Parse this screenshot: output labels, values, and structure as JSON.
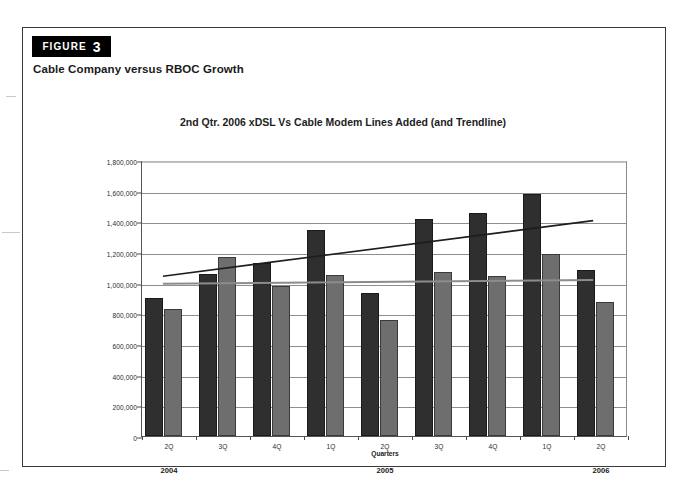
{
  "figure": {
    "banner_word": "FIGURE",
    "banner_number": "3",
    "caption": "Cable Company versus RBOC Growth"
  },
  "chart_data": {
    "type": "bar",
    "title": "2nd Qtr.  2006 xDSL Vs Cable Modem Lines Added (and Trendline)",
    "xlabel": "Quarters",
    "ylabel": "",
    "ylim": [
      0,
      1800000
    ],
    "ytick_step": 200000,
    "grid": true,
    "legend": "none",
    "categories": [
      "2Q",
      "3Q",
      "4Q",
      "1Q",
      "2Q",
      "3Q",
      "4Q",
      "1Q",
      "2Q"
    ],
    "group_labels": [
      {
        "label": "2004",
        "index": 0
      },
      {
        "label": "2005",
        "index": 4
      },
      {
        "label": "2006",
        "index": 8
      }
    ],
    "ytick_labels": [
      "1,800,000",
      "1,600,000",
      "1,400,000",
      "1,200,000",
      "1,000,000",
      "800,000",
      "600,000",
      "400,000",
      "200,000",
      "0"
    ],
    "ytick_values": [
      1800000,
      1600000,
      1400000,
      1200000,
      1000000,
      800000,
      600000,
      400000,
      200000,
      0
    ],
    "series": [
      {
        "name": "xDSL Lines Added",
        "color": "#2f2f2f",
        "values": [
          900000,
          1056000,
          1128000,
          1343000,
          932000,
          1415000,
          1454000,
          1578000,
          1083000
        ]
      },
      {
        "name": "Cable Modem Lines Added",
        "color": "#6e6e6e",
        "values": [
          828000,
          1167000,
          978000,
          1050000,
          756000,
          1070000,
          1044000,
          1187000,
          874000
        ]
      }
    ],
    "trendlines": [
      {
        "name": "xDSL Trendline",
        "color": "#1d1d1d",
        "start_value": 1050000,
        "end_value": 1415000,
        "start_category_index": 0,
        "end_category_index": 8
      },
      {
        "name": "Cable Modem Trendline",
        "color": "#8c8c8c",
        "start_value": 1000000,
        "end_value": 1025000,
        "start_category_index": 0,
        "end_category_index": 8
      }
    ]
  }
}
